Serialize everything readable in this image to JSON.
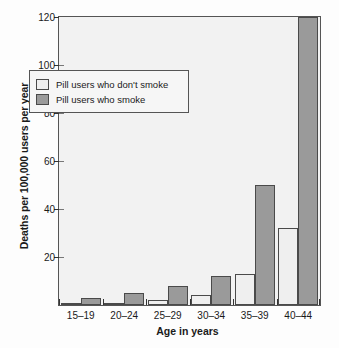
{
  "chart_data": {
    "type": "bar",
    "title": "",
    "xlabel": "Age in years",
    "ylabel": "Deaths per 100,000 users per year",
    "categories": [
      "15–19",
      "20–24",
      "25–29",
      "30–34",
      "35–39",
      "40–44"
    ],
    "series": [
      {
        "name": "Pill users who don't smoke",
        "color": "#efefef",
        "values": [
          1,
          1,
          2,
          4,
          13,
          32
        ]
      },
      {
        "name": "Pill users who smoke",
        "color": "#9a9a9a",
        "values": [
          3,
          5,
          8,
          12,
          50,
          120
        ]
      }
    ],
    "ylim": [
      0,
      120
    ],
    "yticks": [
      0,
      20,
      40,
      60,
      80,
      100,
      120
    ],
    "ytick_labels": [
      "",
      "20",
      "40",
      "60",
      "80",
      "100",
      "120"
    ],
    "grid": false,
    "legend_position": "upper left"
  },
  "legend": {
    "entries": [
      {
        "label": "Pill users who don't smoke",
        "swatch": "light"
      },
      {
        "label": "Pill users who smoke",
        "swatch": "dark"
      }
    ]
  }
}
